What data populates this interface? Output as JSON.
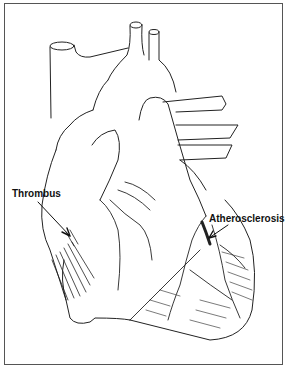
{
  "figure": {
    "stroke_color": "#222222",
    "background": "#ffffff",
    "frame_color": "#555555"
  },
  "labels": {
    "thrombus": "Thrombus",
    "atherosclerosis": "Atherosclerosis"
  }
}
